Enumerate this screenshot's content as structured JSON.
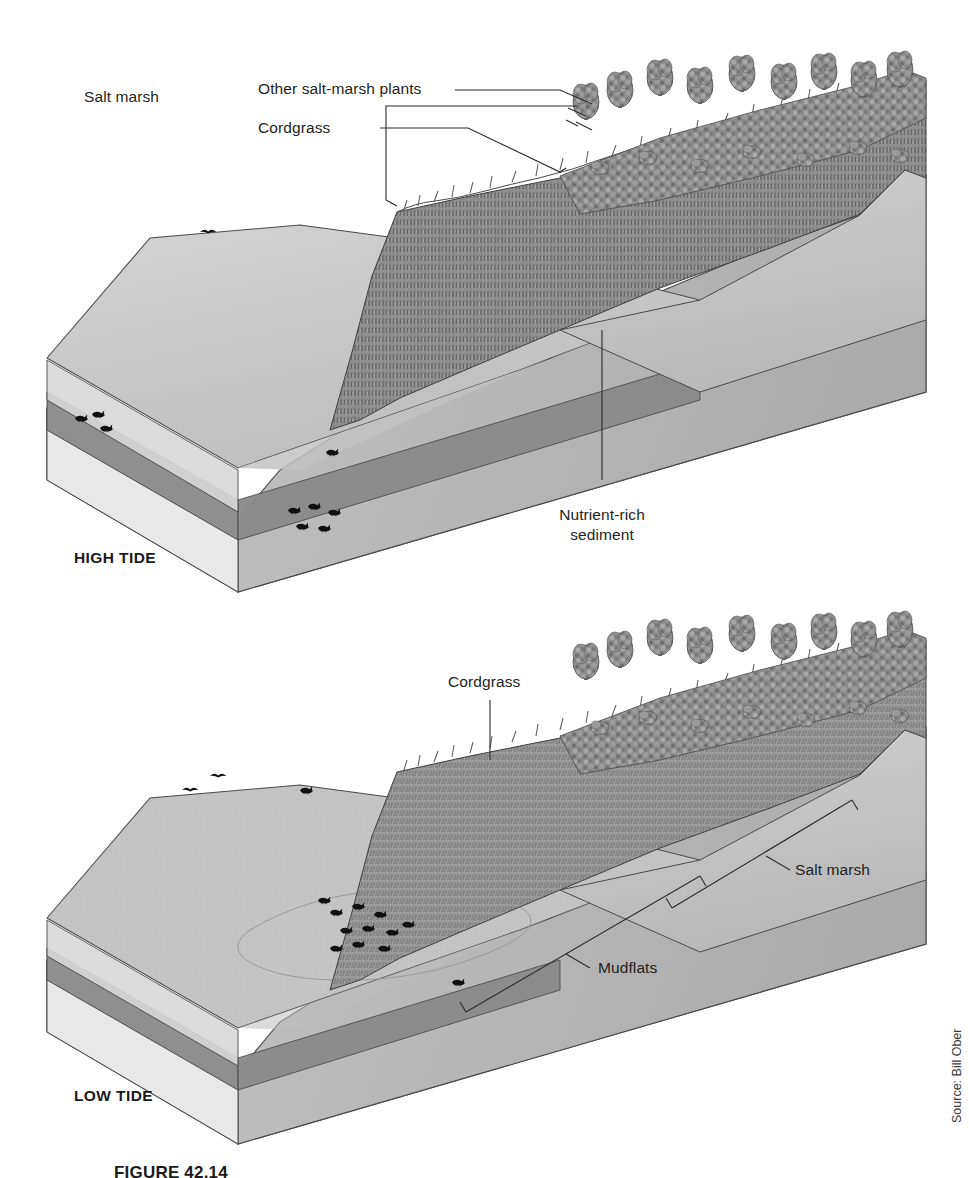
{
  "figure": {
    "caption": "FIGURE 42.14",
    "source_credit": "Source: Bill Ober"
  },
  "panels": [
    {
      "id": "high-tide",
      "tide_label": "HIGH TIDE",
      "labels": {
        "group": "Salt marsh",
        "upper_zone": "Other salt-marsh plants",
        "lower_zone": "Cordgrass",
        "sediment_line1": "Nutrient-rich",
        "sediment_line2": "sediment"
      }
    },
    {
      "id": "low-tide",
      "tide_label": "LOW  TIDE",
      "labels": {
        "cordgrass": "Cordgrass",
        "salt_marsh": "Salt marsh",
        "mudflats": "Mudflats"
      }
    }
  ],
  "colors": {
    "water_surface": "#c9c9c9",
    "water_band": "#9a9a9a",
    "sediment": "#e2e2e2",
    "block_side": "#b8b8b8",
    "marsh_grass": "#8a8a8a",
    "forest": "#7d7d7d",
    "outline": "#3c3c3c",
    "text": "#231f20"
  }
}
